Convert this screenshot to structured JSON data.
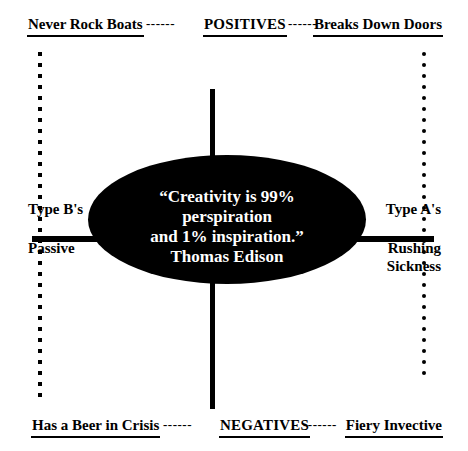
{
  "diagram": {
    "title_axes": {
      "vertical_top": "POSITIVES",
      "vertical_bottom": "NEGATIVES"
    },
    "header": {
      "left_label": "Never Rock Boats",
      "dash_left": "------",
      "center_label": "POSITIVES",
      "dash_right": "------",
      "right_label": "Breaks Down Doors"
    },
    "footer": {
      "left_label": "Has a Beer in Crisis",
      "dash_left": "------",
      "center_label": "NEGATIVES",
      "dash_right": "-------",
      "right_label": "Fiery Invective"
    },
    "left_side": {
      "upper_label": "Type B's",
      "lower_label": "Passive"
    },
    "right_side": {
      "upper_label": "Type A's",
      "lower_label": "Rushing\nSickness"
    },
    "center": {
      "quote": "“Creativity is 99%\nperspiration\nand 1% inspiration.”\nThomas Edison",
      "fill_color": "#000000",
      "text_color": "#ffffff"
    }
  }
}
